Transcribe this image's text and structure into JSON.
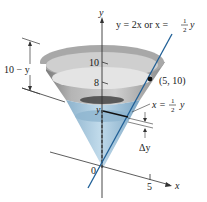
{
  "diagram": {
    "equation_line": "y = 2x or x = ",
    "equation_frac_num": "1",
    "equation_frac_den": "2",
    "equation_tail": "y",
    "axis_y_label": "y",
    "axis_x_label": "x",
    "tick_10": "10",
    "tick_8": "8",
    "tick_x5": "5",
    "origin_label": "0",
    "point_label": "(5, 10)",
    "dim_label": "10 − y",
    "slice_y_label": "y",
    "slice_eq_prefix": "x = ",
    "slice_eq_num": "1",
    "slice_eq_den": "2",
    "slice_eq_tail": "y",
    "delta_label": "Δy",
    "colors": {
      "tank_gray": "#9a9a9a",
      "tank_light": "#d8d8d8",
      "water_blue": "#9cc3dc",
      "water_dark": "#5f8fb0",
      "line_blue": "#1f5f96",
      "axis": "#333333"
    }
  }
}
